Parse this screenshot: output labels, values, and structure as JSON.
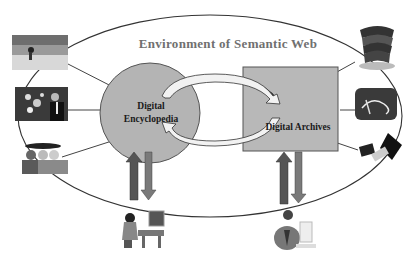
{
  "diagram": {
    "title": "Environment of Semantic Web",
    "nodes": [
      {
        "id": "encyclopedia",
        "shape": "circle",
        "label_line1": "Digital",
        "label_line2": "Encyclopedia",
        "fill": "#b4b4b4"
      },
      {
        "id": "archives",
        "shape": "rectangle",
        "label": "Digital Archives",
        "fill": "#b8b8b8"
      }
    ],
    "left_images": [
      "beach-photo",
      "bubbles-businessman-photo",
      "people-group-icon"
    ],
    "right_images": [
      "book-stack-icon",
      "scroll-diploma-icon",
      "laptop-floppy-icon"
    ],
    "bottom_images": [
      "woman-at-computer-icon",
      "man-at-computer-icon"
    ],
    "edges": [
      {
        "from": "encyclopedia",
        "to": "archives",
        "style": "curved-arrow-top"
      },
      {
        "from": "archives",
        "to": "encyclopedia",
        "style": "curved-arrow-bottom"
      },
      {
        "from": "encyclopedia",
        "to": "woman-at-computer",
        "style": "bidirectional-block-arrows"
      },
      {
        "from": "archives",
        "to": "man-at-computer",
        "style": "bidirectional-block-arrows"
      }
    ],
    "colors": {
      "ellipse_stroke": "#333333",
      "node_fill": "#b4b4b4",
      "arrow_up": "#555555",
      "arrow_down": "#7a7a7a",
      "title": "#707070"
    }
  }
}
